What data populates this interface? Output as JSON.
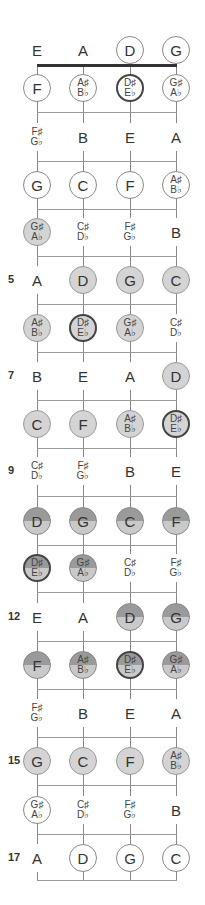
{
  "diagram": {
    "strings": [
      "E",
      "A",
      "D",
      "G"
    ],
    "string_x": [
      37,
      83,
      130,
      176
    ],
    "colors": {
      "line": "#888888",
      "nut": "#333333",
      "light_fill": "#d4d4d4",
      "dark_top": "#9a9a9a",
      "dark_bottom": "#c9c9c9"
    },
    "frets": [
      {
        "fret": 0,
        "label": "",
        "y": 50,
        "notes": [
          {
            "text": [
              "E"
            ],
            "style": "plain"
          },
          {
            "text": [
              "A"
            ],
            "style": "plain"
          },
          {
            "text": [
              "D"
            ],
            "style": "circ"
          },
          {
            "text": [
              "G"
            ],
            "style": "circ"
          }
        ]
      },
      {
        "fret": 1,
        "label": "",
        "y": 88,
        "notes": [
          {
            "text": [
              "F"
            ],
            "style": "circ"
          },
          {
            "text": [
              "A♯",
              "B♭"
            ],
            "style": "circ"
          },
          {
            "text": [
              "D♯",
              "E♭"
            ],
            "style": "circ bold"
          },
          {
            "text": [
              "G♯",
              "A♭"
            ],
            "style": "circ"
          }
        ]
      },
      {
        "fret": 2,
        "label": "",
        "y": 137,
        "notes": [
          {
            "text": [
              "F♯",
              "G♭"
            ],
            "style": "plain"
          },
          {
            "text": [
              "B"
            ],
            "style": "plain"
          },
          {
            "text": [
              "E"
            ],
            "style": "plain"
          },
          {
            "text": [
              "A"
            ],
            "style": "plain"
          }
        ]
      },
      {
        "fret": 3,
        "label": "",
        "y": 185,
        "notes": [
          {
            "text": [
              "G"
            ],
            "style": "circ"
          },
          {
            "text": [
              "C"
            ],
            "style": "circ"
          },
          {
            "text": [
              "F"
            ],
            "style": "circ"
          },
          {
            "text": [
              "A♯",
              "B♭"
            ],
            "style": "circ"
          }
        ]
      },
      {
        "fret": 4,
        "label": "",
        "y": 232,
        "notes": [
          {
            "text": [
              "G♯",
              "A♭"
            ],
            "style": "light"
          },
          {
            "text": [
              "C♯",
              "D♭"
            ],
            "style": "plain"
          },
          {
            "text": [
              "F♯",
              "G♭"
            ],
            "style": "plain"
          },
          {
            "text": [
              "B"
            ],
            "style": "plain"
          }
        ]
      },
      {
        "fret": 5,
        "label": "5",
        "y": 280,
        "notes": [
          {
            "text": [
              "A"
            ],
            "style": "plain"
          },
          {
            "text": [
              "D"
            ],
            "style": "light"
          },
          {
            "text": [
              "G"
            ],
            "style": "light"
          },
          {
            "text": [
              "C"
            ],
            "style": "light"
          }
        ]
      },
      {
        "fret": 6,
        "label": "",
        "y": 328,
        "notes": [
          {
            "text": [
              "A♯",
              "B♭"
            ],
            "style": "light"
          },
          {
            "text": [
              "D♯",
              "E♭"
            ],
            "style": "light bold"
          },
          {
            "text": [
              "G♯",
              "A♭"
            ],
            "style": "light"
          },
          {
            "text": [
              "C♯",
              "D♭"
            ],
            "style": "plain"
          }
        ]
      },
      {
        "fret": 7,
        "label": "7",
        "y": 376,
        "notes": [
          {
            "text": [
              "B"
            ],
            "style": "plain"
          },
          {
            "text": [
              "E"
            ],
            "style": "plain"
          },
          {
            "text": [
              "A"
            ],
            "style": "plain"
          },
          {
            "text": [
              "D"
            ],
            "style": "light"
          }
        ]
      },
      {
        "fret": 8,
        "label": "",
        "y": 424,
        "notes": [
          {
            "text": [
              "C"
            ],
            "style": "light"
          },
          {
            "text": [
              "F"
            ],
            "style": "light"
          },
          {
            "text": [
              "A♯",
              "B♭"
            ],
            "style": "light"
          },
          {
            "text": [
              "D♯",
              "E♭"
            ],
            "style": "light bold"
          }
        ]
      },
      {
        "fret": 9,
        "label": "9",
        "y": 471,
        "notes": [
          {
            "text": [
              "C♯",
              "D♭"
            ],
            "style": "plain"
          },
          {
            "text": [
              "F♯",
              "G♭"
            ],
            "style": "plain"
          },
          {
            "text": [
              "B"
            ],
            "style": "plain"
          },
          {
            "text": [
              "E"
            ],
            "style": "plain"
          }
        ]
      },
      {
        "fret": 10,
        "label": "",
        "y": 521,
        "notes": [
          {
            "text": [
              "D"
            ],
            "style": "split"
          },
          {
            "text": [
              "G"
            ],
            "style": "split"
          },
          {
            "text": [
              "C"
            ],
            "style": "split"
          },
          {
            "text": [
              "F"
            ],
            "style": "split"
          }
        ]
      },
      {
        "fret": 11,
        "label": "",
        "y": 568,
        "notes": [
          {
            "text": [
              "D♯",
              "E♭"
            ],
            "style": "split bold"
          },
          {
            "text": [
              "G♯",
              "A♭"
            ],
            "style": "split"
          },
          {
            "text": [
              "C♯",
              "D♭"
            ],
            "style": "plain"
          },
          {
            "text": [
              "F♯",
              "G♭"
            ],
            "style": "plain"
          }
        ]
      },
      {
        "fret": 12,
        "label": "12",
        "y": 617,
        "notes": [
          {
            "text": [
              "E"
            ],
            "style": "plain"
          },
          {
            "text": [
              "A"
            ],
            "style": "plain"
          },
          {
            "text": [
              "D"
            ],
            "style": "split"
          },
          {
            "text": [
              "G"
            ],
            "style": "split"
          }
        ]
      },
      {
        "fret": 13,
        "label": "",
        "y": 665,
        "notes": [
          {
            "text": [
              "F"
            ],
            "style": "split"
          },
          {
            "text": [
              "A♯",
              "B♭"
            ],
            "style": "split"
          },
          {
            "text": [
              "D♯",
              "E♭"
            ],
            "style": "split bold"
          },
          {
            "text": [
              "G♯",
              "A♭"
            ],
            "style": "split"
          }
        ]
      },
      {
        "fret": 14,
        "label": "",
        "y": 713,
        "notes": [
          {
            "text": [
              "F♯",
              "G♭"
            ],
            "style": "plain"
          },
          {
            "text": [
              "B"
            ],
            "style": "plain"
          },
          {
            "text": [
              "E"
            ],
            "style": "plain"
          },
          {
            "text": [
              "A"
            ],
            "style": "plain"
          }
        ]
      },
      {
        "fret": 15,
        "label": "15",
        "y": 761,
        "notes": [
          {
            "text": [
              "G"
            ],
            "style": "light"
          },
          {
            "text": [
              "C"
            ],
            "style": "light"
          },
          {
            "text": [
              "F"
            ],
            "style": "light"
          },
          {
            "text": [
              "A♯",
              "B♭"
            ],
            "style": "light"
          }
        ]
      },
      {
        "fret": 16,
        "label": "",
        "y": 810,
        "notes": [
          {
            "text": [
              "G♯",
              "A♭"
            ],
            "style": "circ"
          },
          {
            "text": [
              "C♯",
              "D♭"
            ],
            "style": "plain"
          },
          {
            "text": [
              "F♯",
              "G♭"
            ],
            "style": "plain"
          },
          {
            "text": [
              "B"
            ],
            "style": "plain"
          }
        ]
      },
      {
        "fret": 17,
        "label": "17",
        "y": 858,
        "notes": [
          {
            "text": [
              "A"
            ],
            "style": "plain"
          },
          {
            "text": [
              "D"
            ],
            "style": "circ"
          },
          {
            "text": [
              "G"
            ],
            "style": "circ"
          },
          {
            "text": [
              "C"
            ],
            "style": "circ"
          }
        ]
      }
    ],
    "fret_lines_y": [
      112,
      161,
      209,
      256,
      304,
      352,
      400,
      448,
      496,
      545,
      592,
      641,
      689,
      737,
      785,
      834,
      880
    ]
  }
}
